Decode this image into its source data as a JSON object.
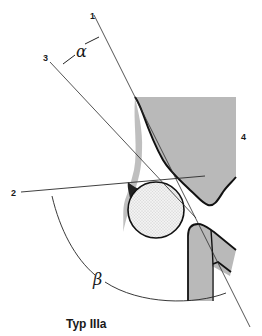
{
  "diagram": {
    "caption": "Typ IIIa",
    "labels": {
      "line_1": "1",
      "line_2": "2",
      "line_3": "3",
      "part_4": "4",
      "angle_alpha": "α",
      "angle_beta": "β"
    },
    "colors": {
      "line": "#2a2a2a",
      "shaded_fill": "#b8b8b8",
      "circle_fill": "#efefef",
      "outline": "#111111"
    }
  }
}
